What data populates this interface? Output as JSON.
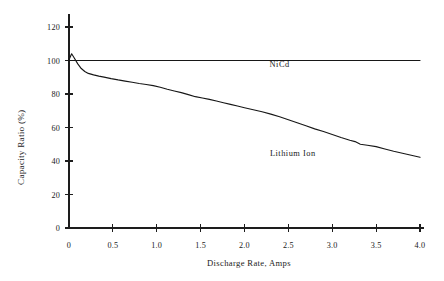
{
  "chart_data": {
    "type": "line",
    "title": "",
    "xlabel": "Discharge Rate, Amps",
    "ylabel": "Capacity Ratio (%)",
    "xlim": [
      0,
      4.0
    ],
    "ylim": [
      0,
      120
    ],
    "grid": false,
    "legend_position": "inline-annotation",
    "xticks": [
      "0",
      "0.5",
      "1.0",
      "1.5",
      "2.0",
      "2.5",
      "3.0",
      "3.5",
      "4.0"
    ],
    "xtick_values": [
      0,
      0.5,
      1.0,
      1.5,
      2.0,
      2.5,
      3.0,
      3.5,
      4.0
    ],
    "yticks": [
      "0",
      "20",
      "40",
      "60",
      "80",
      "100",
      "120"
    ],
    "ytick_values": [
      0,
      20,
      40,
      60,
      80,
      100,
      120
    ],
    "annotations": [
      {
        "text": "NiCd",
        "x": 2.4,
        "y": 96
      },
      {
        "text": "Lithium  Ion",
        "x": 2.55,
        "y": 43
      }
    ],
    "series": [
      {
        "name": "NiCd",
        "color": "#171717",
        "x": [
          0.0,
          4.0
        ],
        "values": [
          100,
          100
        ]
      },
      {
        "name": "Lithium Ion",
        "color": "#171717",
        "x": [
          0.0,
          0.03,
          0.06,
          0.1,
          0.14,
          0.18,
          0.22,
          0.28,
          0.34,
          0.4,
          0.48,
          0.56,
          0.64,
          0.72,
          0.8,
          0.88,
          0.96,
          1.04,
          1.12,
          1.2,
          1.28,
          1.36,
          1.44,
          1.52,
          1.6,
          1.68,
          1.76,
          1.84,
          1.92,
          2.0,
          2.1,
          2.2,
          2.3,
          2.4,
          2.5,
          2.6,
          2.7,
          2.8,
          2.9,
          3.0,
          3.1,
          3.2,
          3.26,
          3.32,
          3.4,
          3.5,
          3.6,
          3.7,
          3.8,
          3.9,
          4.0
        ],
        "values": [
          100.5,
          104.0,
          101.5,
          98.0,
          95.2,
          93.4,
          92.3,
          91.4,
          90.7,
          90.1,
          89.2,
          88.4,
          87.7,
          87.0,
          86.3,
          85.7,
          85.0,
          84.0,
          82.8,
          81.8,
          80.8,
          79.6,
          78.4,
          77.6,
          76.8,
          75.8,
          74.8,
          73.8,
          72.8,
          71.8,
          70.6,
          69.4,
          68.0,
          66.4,
          64.6,
          62.8,
          61.0,
          59.2,
          57.6,
          55.8,
          54.0,
          52.4,
          51.6,
          50.0,
          49.4,
          48.6,
          47.2,
          45.8,
          44.6,
          43.4,
          42.2
        ]
      }
    ]
  },
  "geometry": {
    "plot_left": 69,
    "plot_right": 420,
    "y_zero": 228,
    "y_top_value_px": 27
  }
}
